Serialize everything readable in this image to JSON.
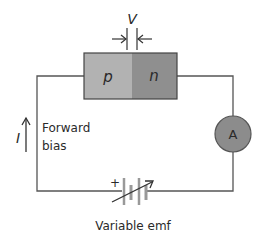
{
  "diagram": {
    "type": "circuit",
    "diode": {
      "p_label": "p",
      "n_label": "n",
      "p_color": "#b2b2b2",
      "n_color": "#8f8f8f"
    },
    "voltage_label": "V",
    "ammeter_label": "A",
    "ammeter_color": "#8c8c8c",
    "current_label": "I",
    "bias_label_line1": "Forward",
    "bias_label_line2": "bias",
    "battery_plus": "+",
    "battery_label": "Variable emf",
    "wire_color": "#555555"
  }
}
